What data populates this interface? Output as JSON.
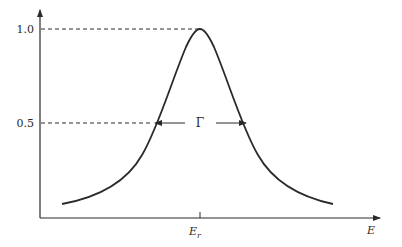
{
  "figure": {
    "y_axis": {
      "ticks": [
        {
          "label": "1.0",
          "value": 1.0
        },
        {
          "label": "0.5",
          "value": 0.5
        }
      ]
    },
    "x_axis": {
      "label": "E",
      "tick_label_main": "E",
      "tick_label_sub": "r"
    },
    "width_label": "Γ",
    "colors": {
      "ink": "#2a2a2a",
      "background": "#ffffff"
    }
  }
}
